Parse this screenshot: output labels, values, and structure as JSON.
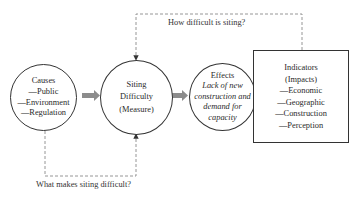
{
  "diagram": {
    "nodes": {
      "causes": {
        "title": "Causes",
        "items": [
          "—Public",
          "—Environment",
          "—Regulation"
        ]
      },
      "siting": {
        "lines": [
          "Siting",
          "Difficulty",
          "(Measure)"
        ]
      },
      "effects": {
        "title": "Effects",
        "italic_lines": [
          "Lack of new",
          "construction and",
          "demand for",
          "capacity"
        ]
      },
      "indicators": {
        "lines": [
          "Indicators",
          "(Impacts)"
        ],
        "items": [
          "—Economic",
          "—Geographic",
          "—Construction",
          "—Perception"
        ]
      }
    },
    "labels": {
      "top_question": "How difficult is siting?",
      "bottom_question": "What makes siting difficult?"
    },
    "edges": [
      {
        "from": "causes",
        "to": "siting",
        "style": "thick-arrow"
      },
      {
        "from": "siting",
        "to": "effects",
        "style": "thick-arrow"
      },
      {
        "from": "indicators",
        "to": "siting",
        "style": "dashed-arrow",
        "label": "How difficult is siting?"
      },
      {
        "from": "causes",
        "to": "siting",
        "style": "dashed-arrow",
        "label": "What makes siting difficult?"
      }
    ],
    "colors": {
      "stroke": "#333333",
      "thick_arrow": "#8c8c8c",
      "dashed": "#8a8a8a"
    }
  }
}
